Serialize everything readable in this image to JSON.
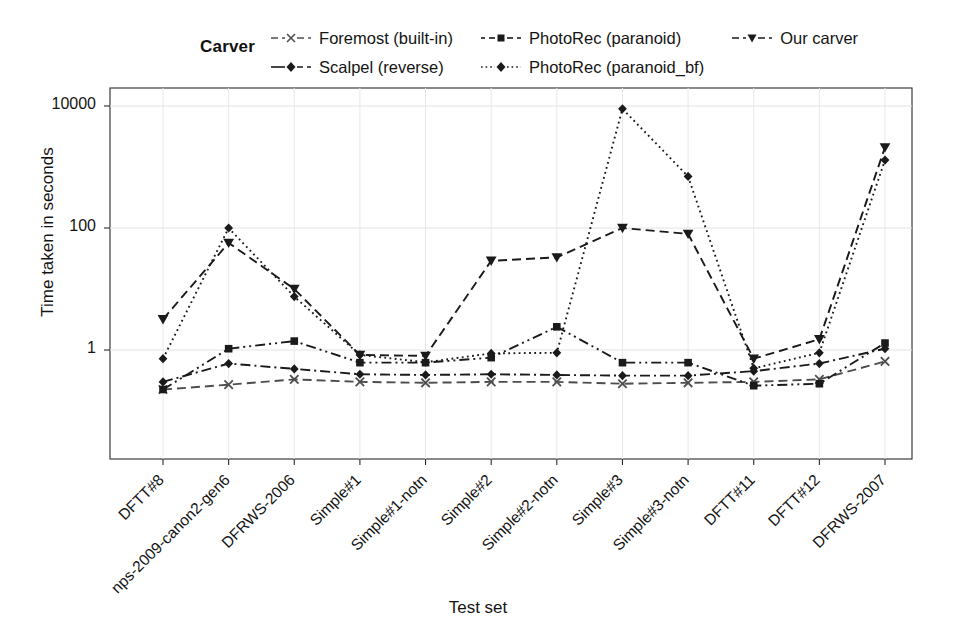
{
  "chart_data": {
    "type": "line",
    "title": "",
    "xlabel": "Test set",
    "ylabel": "Time taken in seconds",
    "yscale": "log",
    "ylim": [
      0.18,
      20000
    ],
    "yticks": [
      1,
      100,
      10000
    ],
    "ytick_labels": [
      "1",
      "100",
      "10000"
    ],
    "grid": true,
    "legend_title": "Carver",
    "legend_position": "top",
    "categories": [
      "DFTT#8",
      "nps-2009-canon2-gen6",
      "DFRWS-2006",
      "Simple#1",
      "Simple#1-notn",
      "Simple#2",
      "Simple#2-notn",
      "Simple#3",
      "Simple#3-notn",
      "DFTT#11",
      "DFTT#12",
      "DFRWS-2007"
    ],
    "series": [
      {
        "name": "Foremost (built-in)",
        "marker": "cross",
        "dash": "long-dash",
        "color": "#4d4d4d",
        "values": [
          0.225,
          0.27,
          0.33,
          0.3,
          0.29,
          0.3,
          0.3,
          0.28,
          0.29,
          0.3,
          0.33,
          0.65
        ]
      },
      {
        "name": "Scalpel (reverse)",
        "marker": "diamond",
        "dash": "dash-dot",
        "color": "#1a1a1a",
        "values": [
          0.3,
          0.6,
          0.49,
          0.4,
          0.39,
          0.4,
          0.39,
          0.38,
          0.38,
          0.45,
          0.6,
          1.05
        ]
      },
      {
        "name": "PhotoRec (paranoid)",
        "marker": "square",
        "dash": "dash-dot-2",
        "color": "#1a1a1a",
        "values": [
          0.225,
          1.05,
          1.4,
          0.62,
          0.62,
          0.75,
          2.4,
          0.62,
          0.62,
          0.26,
          0.28,
          1.3
        ]
      },
      {
        "name": "PhotoRec (paranoid_bf)",
        "marker": "diamond",
        "dash": "dotted",
        "color": "#1a1a1a",
        "values": [
          0.72,
          100.0,
          7.5,
          0.83,
          0.63,
          0.88,
          0.9,
          9000.0,
          700.0,
          0.5,
          0.9,
          1300.0
        ]
      },
      {
        "name": "Our carver",
        "marker": "triangle-down",
        "dash": "dash",
        "color": "#1a1a1a",
        "values": [
          3.2,
          57.0,
          10.0,
          0.83,
          0.8,
          29.0,
          33.0,
          100.0,
          80.0,
          0.72,
          1.5,
          2100.0
        ]
      }
    ]
  },
  "plot": {
    "left": 110,
    "right": 912,
    "top": 88,
    "bottom": 459
  }
}
